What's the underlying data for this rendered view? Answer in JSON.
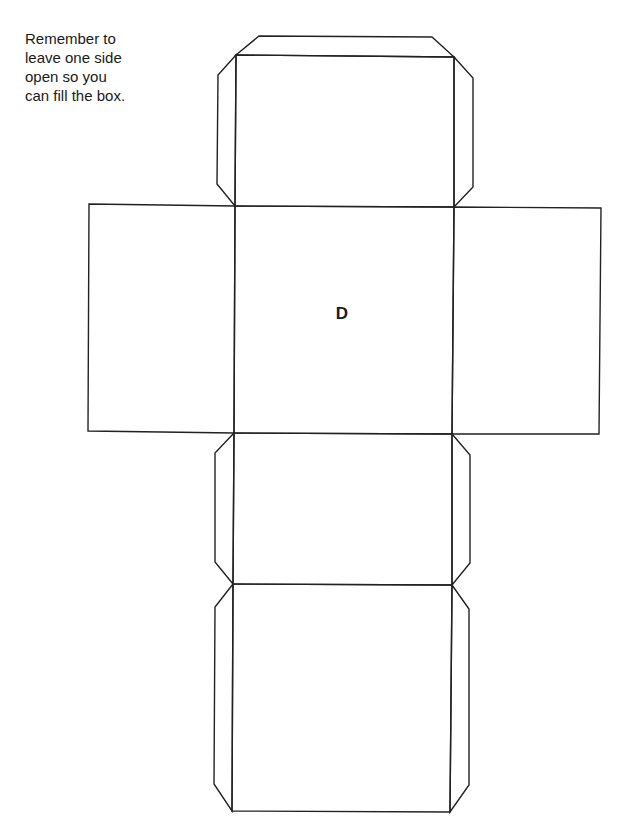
{
  "instructions": {
    "lines": [
      "Remember to",
      "leave one side",
      "open so you",
      "can fill the box."
    ]
  },
  "center_face_label": "D",
  "colors": {
    "line": "#222222",
    "background": "#ffffff"
  },
  "net": {
    "faces": [
      {
        "name": "face-top",
        "points": "236,55 454,57 454,207 235,206"
      },
      {
        "name": "face-left",
        "points": "89,204 235,206 234,433 88,431"
      },
      {
        "name": "face-center",
        "points": "235,206 454,207 452,434 234,433"
      },
      {
        "name": "face-right",
        "points": "454,207 601,208 599,434 452,434"
      },
      {
        "name": "face-lower",
        "points": "234,433 452,434 452,585 233,584"
      },
      {
        "name": "face-bottom",
        "points": "233,584 452,585 450,812 232,811"
      }
    ],
    "tabs": [
      {
        "name": "tab-top",
        "points": "236,55 259,36 432,37 454,57"
      },
      {
        "name": "tab-top-left",
        "points": "236,55 218,75 217,184 235,206"
      },
      {
        "name": "tab-top-right",
        "points": "454,57 473,78 473,187 454,207"
      },
      {
        "name": "tab-lower-left",
        "points": "234,433 215,453 215,562 233,584"
      },
      {
        "name": "tab-lower-right",
        "points": "452,434 470,455 470,563 452,585"
      },
      {
        "name": "tab-bottom-left",
        "points": "233,584 215,607 214,784 232,811"
      },
      {
        "name": "tab-bottom-right",
        "points": "452,585 469,609 469,785 450,812"
      }
    ]
  }
}
